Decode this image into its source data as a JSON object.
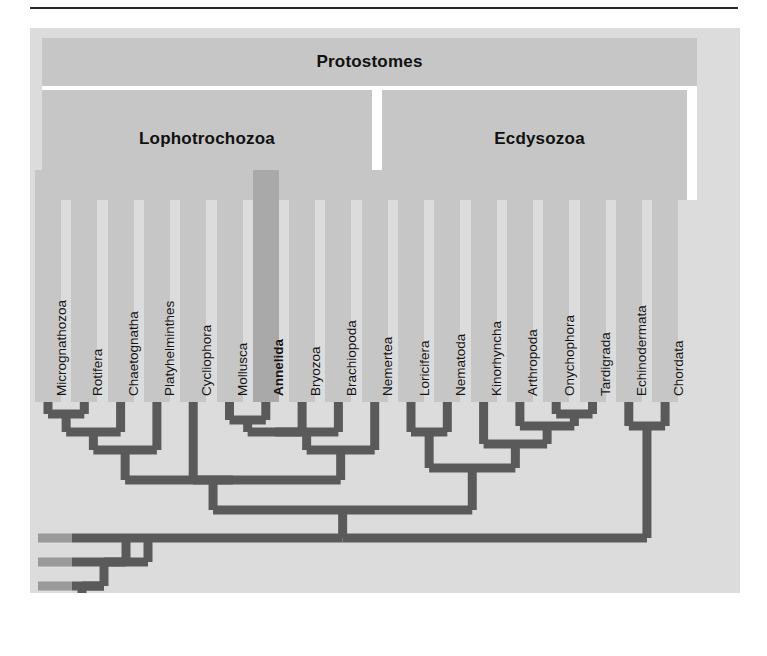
{
  "figure": {
    "type": "cladogram",
    "title_banners": {
      "protostomes": "Protostomes",
      "lophotrochozoa": "Lophotrochozoa",
      "ecdysozoa": "Ecdysozoa"
    },
    "highlighted_taxon": "Annelida",
    "colors": {
      "panel_background": "#dcdcdc",
      "banner": "#c6c6c6",
      "tip_column": "#c6c6c6",
      "tip_column_highlight": "#a9a9a9",
      "branch": "#5a5a5a",
      "stub": "#9a9a9a",
      "divider": "#ffffff",
      "rule": "#2b2b2b",
      "text": "#151515"
    }
  },
  "chart_data": {
    "type": "tree",
    "group_labels": [
      "Protostomes",
      "Lophotrochozoa",
      "Ecdysozoa"
    ],
    "taxa": [
      {
        "index": 0,
        "label": "Micrognathozoa",
        "group": "Lophotrochozoa",
        "highlighted": false
      },
      {
        "index": 1,
        "label": "Rotifera",
        "group": "Lophotrochozoa",
        "highlighted": false
      },
      {
        "index": 2,
        "label": "Chaetognatha",
        "group": "Lophotrochozoa",
        "highlighted": false
      },
      {
        "index": 3,
        "label": "Platyhelminthes",
        "group": "Lophotrochozoa",
        "highlighted": false
      },
      {
        "index": 4,
        "label": "Cycliophora",
        "group": "Lophotrochozoa",
        "highlighted": false
      },
      {
        "index": 5,
        "label": "Mollusca",
        "group": "Lophotrochozoa",
        "highlighted": false
      },
      {
        "index": 6,
        "label": "Annelida",
        "group": "Lophotrochozoa",
        "highlighted": true
      },
      {
        "index": 7,
        "label": "Bryozoa",
        "group": "Lophotrochozoa",
        "highlighted": false
      },
      {
        "index": 8,
        "label": "Brachiopoda",
        "group": "Lophotrochozoa",
        "highlighted": false
      },
      {
        "index": 9,
        "label": "Nemertea",
        "group": "Lophotrochozoa",
        "highlighted": false
      },
      {
        "index": 10,
        "label": "Loricifera",
        "group": "Ecdysozoa",
        "highlighted": false
      },
      {
        "index": 11,
        "label": "Nematoda",
        "group": "Ecdysozoa",
        "highlighted": false
      },
      {
        "index": 12,
        "label": "Kinorhyncha",
        "group": "Ecdysozoa",
        "highlighted": false
      },
      {
        "index": 13,
        "label": "Arthropoda",
        "group": "Ecdysozoa",
        "highlighted": false
      },
      {
        "index": 14,
        "label": "Onychophora",
        "group": "Ecdysozoa",
        "highlighted": false
      },
      {
        "index": 15,
        "label": "Tardigrada",
        "group": "Ecdysozoa",
        "highlighted": false
      },
      {
        "index": 16,
        "label": "Echinodermata",
        "group": "",
        "highlighted": false
      },
      {
        "index": 17,
        "label": "Chordata",
        "group": "",
        "highlighted": false
      }
    ],
    "unlabeled_outgroup_stubs": 4,
    "clades": [
      {
        "members": [
          "Micrognathozoa",
          "Rotifera"
        ]
      },
      {
        "members": [
          "Micrognathozoa",
          "Rotifera",
          "Chaetognatha"
        ]
      },
      {
        "members": [
          "Micrognathozoa",
          "Rotifera",
          "Chaetognatha",
          "Platyhelminthes"
        ]
      },
      {
        "members": [
          "Mollusca",
          "Annelida"
        ]
      },
      {
        "members": [
          "Mollusca",
          "Annelida",
          "Bryozoa",
          "Brachiopoda",
          "Nemertea"
        ]
      },
      {
        "members": [
          "Lophotrochozoa"
        ]
      },
      {
        "members": [
          "Loricifera",
          "Nematoda"
        ]
      },
      {
        "members": [
          "Onychophora",
          "Tardigrada"
        ]
      },
      {
        "members": [
          "Kinorhyncha",
          "Arthropoda",
          "Onychophora",
          "Tardigrada"
        ]
      },
      {
        "members": [
          "Ecdysozoa"
        ]
      },
      {
        "members": [
          "Echinodermata",
          "Chordata"
        ]
      },
      {
        "members": [
          "Protostomes",
          "Deuterostomes"
        ]
      }
    ]
  }
}
